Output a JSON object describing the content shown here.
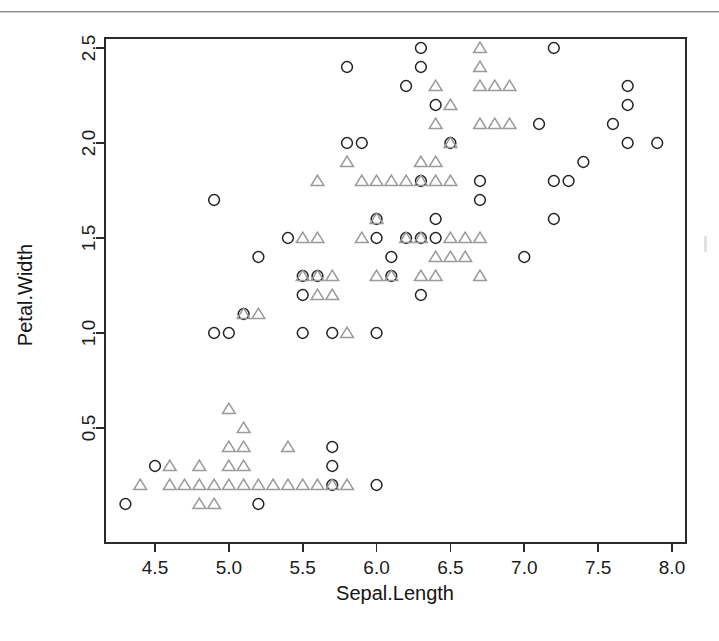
{
  "figure": {
    "background_color": "#ffffff",
    "ink_color": "#2a2a2a",
    "page_rule_color": "#8a8a8a"
  },
  "axes": {
    "x_title": "Sepal.Length",
    "y_title": "Petal.Width",
    "x_ticks": [
      "4.5",
      "5.0",
      "5.5",
      "6.0",
      "6.5",
      "7.0",
      "7.5",
      "8.0"
    ],
    "y_ticks": [
      "0.5",
      "1.0",
      "1.5",
      "2.0",
      "2.5"
    ]
  },
  "chart_data": {
    "type": "scatter",
    "title": "",
    "subtitle": "",
    "xlabel": "Sepal.Length",
    "ylabel": "Petal.Width",
    "xlim": [
      4.2,
      8.05
    ],
    "ylim": [
      0.05,
      2.6
    ],
    "x_ticks": [
      4.5,
      5.0,
      5.5,
      6.0,
      6.5,
      7.0,
      7.5,
      8.0
    ],
    "y_ticks": [
      0.5,
      1.0,
      1.5,
      2.0,
      2.5
    ],
    "grid": false,
    "legend": "none",
    "legend_position": "none",
    "annotations": [],
    "marker_shapes": [
      "circle",
      "triangle"
    ],
    "marker_colors": [
      "#222222",
      "#9a9a9a"
    ],
    "series": [
      {
        "name": "circle",
        "marker": "circle",
        "color": "#222222",
        "points": [
          [
            4.3,
            0.1
          ],
          [
            4.9,
            1.7
          ],
          [
            4.9,
            1.0
          ],
          [
            5.0,
            1.0
          ],
          [
            5.1,
            1.1
          ],
          [
            4.5,
            0.3
          ],
          [
            5.5,
            1.0
          ],
          [
            5.2,
            0.1
          ],
          [
            5.4,
            1.5
          ],
          [
            5.2,
            1.4
          ],
          [
            5.5,
            1.2
          ],
          [
            5.5,
            1.3
          ],
          [
            5.6,
            1.3
          ],
          [
            5.7,
            0.4
          ],
          [
            5.7,
            0.3
          ],
          [
            5.7,
            1.0
          ],
          [
            5.8,
            2.4
          ],
          [
            5.8,
            2.0
          ],
          [
            5.7,
            0.2
          ],
          [
            5.9,
            2.0
          ],
          [
            6.0,
            1.0
          ],
          [
            6.0,
            1.5
          ],
          [
            6.0,
            1.6
          ],
          [
            6.1,
            1.4
          ],
          [
            6.0,
            0.2
          ],
          [
            6.1,
            1.3
          ],
          [
            6.2,
            2.3
          ],
          [
            6.2,
            1.5
          ],
          [
            6.3,
            2.5
          ],
          [
            6.3,
            2.4
          ],
          [
            6.3,
            1.5
          ],
          [
            6.3,
            1.2
          ],
          [
            6.3,
            1.8
          ],
          [
            6.4,
            2.2
          ],
          [
            6.4,
            1.5
          ],
          [
            6.4,
            1.6
          ],
          [
            6.5,
            2.0
          ],
          [
            6.7,
            1.8
          ],
          [
            6.7,
            1.7
          ],
          [
            7.1,
            2.1
          ],
          [
            7.2,
            2.5
          ],
          [
            7.2,
            1.6
          ],
          [
            7.2,
            1.8
          ],
          [
            7.3,
            1.8
          ],
          [
            7.4,
            1.9
          ],
          [
            7.6,
            2.1
          ],
          [
            7.7,
            2.3
          ],
          [
            7.7,
            2.2
          ],
          [
            7.7,
            2.0
          ],
          [
            7.9,
            2.0
          ],
          [
            7.0,
            1.4
          ]
        ]
      },
      {
        "name": "triangle",
        "marker": "triangle",
        "color": "#9a9a9a",
        "points": [
          [
            4.4,
            0.2
          ],
          [
            4.6,
            0.3
          ],
          [
            4.6,
            0.2
          ],
          [
            4.7,
            0.2
          ],
          [
            4.8,
            0.3
          ],
          [
            4.8,
            0.2
          ],
          [
            4.8,
            0.1
          ],
          [
            4.9,
            0.2
          ],
          [
            4.9,
            0.1
          ],
          [
            5.0,
            0.6
          ],
          [
            5.0,
            0.4
          ],
          [
            5.0,
            0.3
          ],
          [
            5.0,
            0.2
          ],
          [
            5.1,
            0.5
          ],
          [
            5.1,
            0.4
          ],
          [
            5.1,
            0.3
          ],
          [
            5.1,
            0.2
          ],
          [
            5.2,
            0.2
          ],
          [
            5.3,
            0.2
          ],
          [
            5.4,
            0.4
          ],
          [
            5.4,
            0.2
          ],
          [
            5.5,
            0.2
          ],
          [
            5.6,
            0.2
          ],
          [
            5.7,
            0.2
          ],
          [
            5.8,
            0.2
          ],
          [
            5.1,
            1.1
          ],
          [
            5.2,
            1.1
          ],
          [
            5.5,
            1.3
          ],
          [
            5.6,
            1.3
          ],
          [
            5.7,
            1.3
          ],
          [
            5.6,
            1.2
          ],
          [
            5.7,
            1.2
          ],
          [
            5.5,
            1.5
          ],
          [
            5.8,
            1.0
          ],
          [
            5.6,
            1.5
          ],
          [
            5.9,
            1.5
          ],
          [
            6.0,
            1.6
          ],
          [
            6.0,
            1.3
          ],
          [
            6.1,
            1.3
          ],
          [
            6.2,
            1.5
          ],
          [
            6.3,
            1.5
          ],
          [
            6.3,
            1.3
          ],
          [
            6.4,
            1.3
          ],
          [
            6.5,
            1.5
          ],
          [
            6.4,
            1.4
          ],
          [
            6.5,
            1.4
          ],
          [
            6.6,
            1.4
          ],
          [
            6.6,
            1.5
          ],
          [
            6.7,
            1.5
          ],
          [
            6.7,
            1.3
          ],
          [
            5.8,
            1.9
          ],
          [
            5.9,
            1.8
          ],
          [
            6.0,
            1.8
          ],
          [
            6.1,
            1.8
          ],
          [
            6.2,
            1.8
          ],
          [
            6.3,
            1.8
          ],
          [
            6.4,
            1.8
          ],
          [
            6.5,
            1.8
          ],
          [
            6.3,
            1.9
          ],
          [
            6.4,
            1.9
          ],
          [
            6.5,
            2.2
          ],
          [
            6.4,
            2.3
          ],
          [
            6.4,
            2.1
          ],
          [
            6.5,
            2.0
          ],
          [
            6.7,
            2.5
          ],
          [
            6.7,
            2.4
          ],
          [
            6.7,
            2.3
          ],
          [
            6.8,
            2.3
          ],
          [
            6.9,
            2.3
          ],
          [
            6.7,
            2.1
          ],
          [
            6.8,
            2.1
          ],
          [
            6.9,
            2.1
          ],
          [
            5.6,
            1.8
          ]
        ]
      }
    ]
  }
}
